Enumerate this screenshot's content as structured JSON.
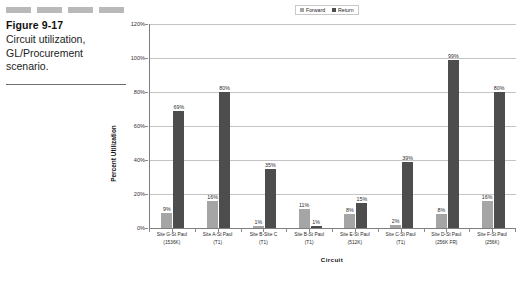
{
  "figure": {
    "title": "Figure 9-17",
    "caption": "Circuit utilization, GL/Procurement scenario.",
    "deco_rule_count": 4
  },
  "legend": {
    "position": "top-center",
    "items": [
      {
        "label": "Forward",
        "color": "#a5a5a5"
      },
      {
        "label": "Return",
        "color": "#4d4d4d"
      }
    ]
  },
  "axes": {
    "ylabel": "Percent Utilization",
    "xlabel": "Circuit",
    "yticks": [
      "0%",
      "20%",
      "40%",
      "60%",
      "80%",
      "100%",
      "120%"
    ]
  },
  "chart_data": {
    "type": "bar",
    "title": "",
    "xlabel": "Circuit",
    "ylabel": "Percent Utilization",
    "ylim": [
      0,
      120
    ],
    "ytick_values": [
      0,
      20,
      40,
      60,
      80,
      100,
      120
    ],
    "ytick_labels": [
      "0%",
      "20%",
      "40%",
      "60%",
      "80%",
      "100%",
      "120%"
    ],
    "grid": true,
    "legend_position": "top-center",
    "categories": [
      "Site G-St Paul (1536K)",
      "Site A-St Paul (T1)",
      "Site B-Site C (T1)",
      "Site B-St Paul (T1)",
      "Site E-St Paul (512K)",
      "Site C-St Paul (T1)",
      "Site D-St Paul (256K FR)",
      "Site F-St Paul (256K)"
    ],
    "category_lines": [
      {
        "l1": "Site G-St Paul",
        "l2": "(1536K)"
      },
      {
        "l1": "Site A-St Paul",
        "l2": "(T1)"
      },
      {
        "l1": "Site B-Site C",
        "l2": "(T1)"
      },
      {
        "l1": "Site B-St Paul",
        "l2": "(T1)"
      },
      {
        "l1": "Site E-St Paul",
        "l2": "(512K)"
      },
      {
        "l1": "Site C-St Paul",
        "l2": "(T1)"
      },
      {
        "l1": "Site D-St Paul",
        "l2": "(256K FR)"
      },
      {
        "l1": "Site F-St Paul",
        "l2": "(256K)"
      }
    ],
    "series": [
      {
        "name": "Forward",
        "color": "#a5a5a5",
        "values": [
          9,
          16,
          1,
          11,
          8,
          2,
          8,
          16
        ],
        "labels": [
          "9%",
          "16%",
          "1%",
          "11%",
          "8%",
          "2%",
          "8%",
          "16%"
        ]
      },
      {
        "name": "Return",
        "color": "#4d4d4d",
        "values": [
          69,
          80,
          35,
          1,
          15,
          39,
          99,
          80
        ],
        "labels": [
          "69%",
          "80%",
          "35%",
          "1%",
          "15%",
          "39%",
          "99%",
          "80%"
        ]
      }
    ]
  }
}
